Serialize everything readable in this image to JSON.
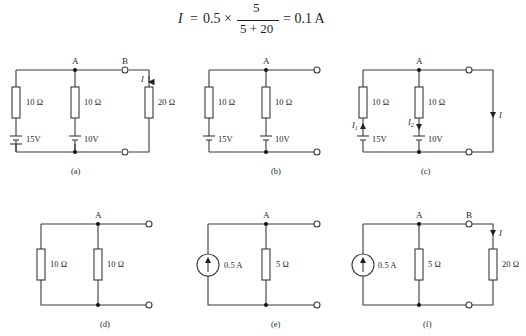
{
  "equation": {
    "lhs": "I",
    "equals1": "=",
    "factor": "0.5 ×",
    "numerator": "5",
    "denominator": "5 + 20",
    "equals2": "= 0.1 A"
  },
  "circuits": [
    {
      "id": "a",
      "caption": "(a)",
      "nodes": {
        "A": "A",
        "B": "B"
      },
      "resistors": [
        "10 Ω",
        "10 Ω",
        "20 Ω"
      ],
      "batteries": [
        "15V",
        "10V"
      ],
      "current_label": "I"
    },
    {
      "id": "b",
      "caption": "(b)",
      "nodes": {
        "A": "A"
      },
      "resistors": [
        "10 Ω",
        "10 Ω"
      ],
      "batteries": [
        "15V",
        "10V"
      ]
    },
    {
      "id": "c",
      "caption": "(c)",
      "nodes": {
        "A": "A"
      },
      "resistors": [
        "10 Ω",
        "10 Ω"
      ],
      "batteries": [
        "15V",
        "10V"
      ],
      "current_labels": {
        "i1": "I",
        "i1_sub": "1",
        "i2": "I",
        "i2_sub": "2",
        "i": "I"
      }
    },
    {
      "id": "d",
      "caption": "(d)",
      "nodes": {
        "A": "A"
      },
      "resistors": [
        "10 Ω",
        "10 Ω"
      ]
    },
    {
      "id": "e",
      "caption": "(e)",
      "nodes": {
        "A": "A"
      },
      "current_source": "0.5 A",
      "resistors": [
        "5 Ω"
      ]
    },
    {
      "id": "f",
      "caption": "(f)",
      "nodes": {
        "A": "A",
        "B": "B"
      },
      "current_source": "0.5 A",
      "resistors": [
        "5 Ω",
        "20 Ω"
      ],
      "current_label": "I"
    }
  ]
}
